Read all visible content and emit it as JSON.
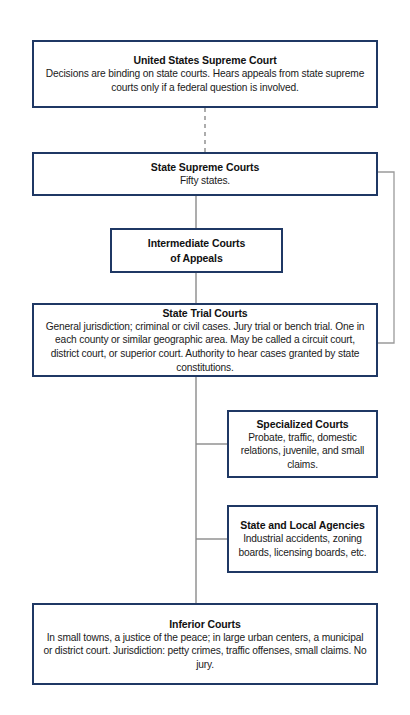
{
  "diagram": {
    "colors": {
      "box_border": "#1f3864",
      "connector_solid": "#7f7f7f",
      "connector_dashed": "#7f7f7f",
      "background": "#ffffff",
      "text": "#1a1a1a"
    },
    "nodes": [
      {
        "id": "us-supreme",
        "title": "United States Supreme Court",
        "body": "Decisions are binding on state courts. Hears appeals from state supreme courts only if a federal question is involved."
      },
      {
        "id": "state-supreme",
        "title": "State Supreme Courts",
        "body": "Fifty states."
      },
      {
        "id": "intermediate",
        "title": "Intermediate Courts",
        "title_line2": "of Appeals",
        "body": ""
      },
      {
        "id": "state-trial",
        "title": "State Trial Courts",
        "body": "General jurisdiction; criminal or civil cases. Jury trial or bench trial. One in each county or similar geographic area. May be called a circuit court, district court, or superior court. Authority to hear cases granted by state constitutions."
      },
      {
        "id": "specialized",
        "title": "Specialized Courts",
        "body": "Probate, traffic, domestic relations, juvenile, and small claims."
      },
      {
        "id": "agencies",
        "title": "State and Local Agencies",
        "body": "Industrial accidents, zoning boards, licensing boards, etc."
      },
      {
        "id": "inferior",
        "title": "Inferior Courts",
        "body": "In small towns, a justice of the peace; in large urban centers, a municipal or district court. Jurisdiction: petty crimes, traffic offenses, small claims. No jury."
      }
    ],
    "connectors": [
      {
        "id": "us-to-state-supreme",
        "style": "dashed",
        "from": "us-supreme",
        "to": "state-supreme"
      },
      {
        "id": "state-supreme-to-intermediate",
        "style": "solid",
        "from": "state-supreme",
        "to": "intermediate"
      },
      {
        "id": "intermediate-to-state-trial",
        "style": "solid",
        "from": "intermediate",
        "to": "state-trial"
      },
      {
        "id": "state-supreme-bypass-to-state-trial",
        "style": "solid-right-bypass",
        "from": "state-supreme",
        "to": "state-trial"
      },
      {
        "id": "state-trial-to-specialized",
        "style": "solid-branch",
        "from": "state-trial",
        "to": "specialized"
      },
      {
        "id": "state-trial-to-agencies",
        "style": "solid-branch",
        "from": "state-trial",
        "to": "agencies"
      },
      {
        "id": "state-trial-to-inferior",
        "style": "solid",
        "from": "state-trial",
        "to": "inferior"
      }
    ]
  }
}
